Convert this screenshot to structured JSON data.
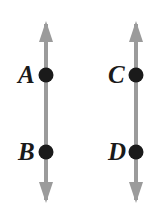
{
  "figure": {
    "background_color": "#ffffff",
    "width": 167,
    "height": 216,
    "line_color": "#9b9b9b",
    "point_color": "#1a1a1a",
    "label_color": "#1a1a1a",
    "lines": [
      {
        "name": "left-line",
        "x": 46,
        "top_y": 22,
        "bottom_y": 202,
        "arrow_top": true,
        "arrow_bottom": true
      },
      {
        "name": "right-line",
        "x": 136,
        "top_y": 22,
        "bottom_y": 202,
        "arrow_top": true,
        "arrow_bottom": true
      }
    ],
    "points": [
      {
        "label": "A",
        "x": 46,
        "y": 75,
        "line": "left-line"
      },
      {
        "label": "B",
        "x": 46,
        "y": 152,
        "line": "left-line"
      },
      {
        "label": "C",
        "x": 136,
        "y": 75,
        "line": "right-line"
      },
      {
        "label": "D",
        "x": 136,
        "y": 152,
        "line": "right-line"
      }
    ],
    "labels": {
      "a": "A",
      "b": "B",
      "c": "C",
      "d": "D"
    }
  }
}
